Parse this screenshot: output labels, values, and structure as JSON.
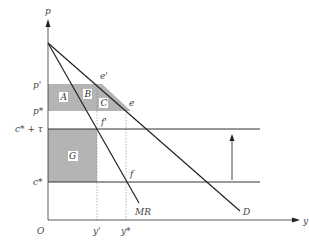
{
  "caption": "图 X.X 出口补贴与关税对垄断厂商的影响",
  "axes": {
    "y_label": "p",
    "x_label": "y",
    "origin_label": "O"
  },
  "price_labels": {
    "p_prime": "p'",
    "p_star": "p*",
    "c_tau": "c* + τ",
    "c_star": "c*"
  },
  "quantity_labels": {
    "y_prime": "y'",
    "y_star": "y*"
  },
  "curve_labels": {
    "mr": "MR",
    "d": "D"
  },
  "point_labels": {
    "e_prime": "e'",
    "e": "e",
    "f_prime": "f'",
    "f": "f"
  },
  "region_labels": {
    "a": "A",
    "b": "B",
    "c": "C",
    "g": "G"
  },
  "colors": {
    "shade": "#b4b4b4",
    "line": "#222222",
    "guide": "#888888"
  }
}
